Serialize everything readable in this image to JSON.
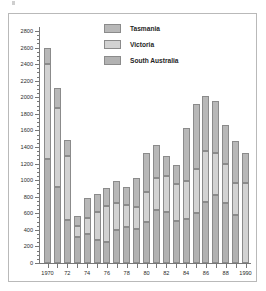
{
  "chart_data": {
    "type": "bar",
    "title": "",
    "subtitle": "",
    "xlabel": "",
    "ylabel": "",
    "stacked": true,
    "grid": false,
    "legend_position": "top-center",
    "ylim": [
      0,
      2800
    ],
    "ytick_step": 200,
    "ytick_labels": [
      "0",
      "200",
      "400",
      "600",
      "800",
      "1000",
      "1200",
      "1400",
      "1600",
      "1800",
      "2000",
      "2200",
      "2400",
      "2600",
      "2800"
    ],
    "categories": [
      1970,
      1971,
      1972,
      1973,
      1974,
      1975,
      1976,
      1977,
      1978,
      1979,
      1980,
      1981,
      1982,
      1983,
      1984,
      1985,
      1986,
      1987,
      1988,
      1989,
      1990
    ],
    "xtick_labels": [
      "1970",
      "",
      "72",
      "",
      "74",
      "",
      "76",
      "",
      "78",
      "",
      "80",
      "",
      "82",
      "",
      "84",
      "",
      "86",
      "",
      "88",
      "",
      "1990"
    ],
    "series": [
      {
        "name": "South Australia",
        "color": "#b2b2b2",
        "values": [
          1260,
          920,
          520,
          320,
          350,
          280,
          255,
          400,
          440,
          405,
          500,
          645,
          620,
          505,
          535,
          600,
          740,
          820,
          720,
          580,
          0
        ]
      },
      {
        "name": "Victoria",
        "color": "#d2d2d2",
        "values": [
          1140,
          945,
          770,
          130,
          195,
          340,
          430,
          320,
          260,
          275,
          360,
          380,
          425,
          445,
          460,
          530,
          610,
          510,
          480,
          380,
          960
        ]
      },
      {
        "name": "Tasmania",
        "color": "#b8b8b8",
        "values": [
          200,
          245,
          190,
          120,
          235,
          210,
          220,
          275,
          215,
          345,
          470,
          405,
          250,
          230,
          630,
          790,
          670,
          630,
          460,
          510,
          370
        ]
      }
    ],
    "totals": [
      2600,
      2110,
      1480,
      570,
      780,
      830,
      905,
      995,
      915,
      1025,
      1330,
      1430,
      1295,
      1180,
      1625,
      1920,
      2020,
      1960,
      1660,
      1470,
      1330
    ]
  },
  "legend": {
    "items": [
      {
        "label": "Tasmania",
        "swatch": "tas"
      },
      {
        "label": "Victoria",
        "swatch": "vic"
      },
      {
        "label": "South Australia",
        "swatch": "sa"
      }
    ]
  }
}
